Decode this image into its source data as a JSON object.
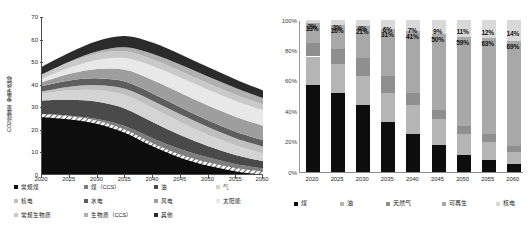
{
  "left_chart": {
    "ylabel": "CO2排放量（发电+终端）",
    "yticks": [
      "70",
      "60",
      "50",
      "40",
      "30",
      "20",
      "10",
      "0"
    ],
    "xticks": [
      "2020",
      "2025",
      "2030",
      "2035",
      "2040",
      "2045",
      "2050",
      "2055",
      "2060"
    ],
    "legend": [
      {
        "label": "常规煤",
        "color": "#0d0d0d"
      },
      {
        "label": "煤（CCS）",
        "color": "#7d7d7d"
      },
      {
        "label": "油",
        "color": "#4a4a4a"
      },
      {
        "label": "气",
        "color": "#d4d4d4"
      },
      {
        "label": "核电",
        "color": "#bfbfbf"
      },
      {
        "label": "水电",
        "color": "#5e5e5e"
      },
      {
        "label": "风电",
        "color": "#9e9e9e"
      },
      {
        "label": "太阳能",
        "color": "#e8e8e8"
      },
      {
        "label": "常规生物质",
        "color": "#c9c9c9"
      },
      {
        "label": "生物质（CCS）",
        "color": "#b0b0b0"
      },
      {
        "label": "其他",
        "color": "#2b2b2b"
      }
    ]
  },
  "right_chart": {
    "yticks": [
      "100%",
      "80%",
      "60%",
      "40%",
      "20%",
      "0%"
    ],
    "xticks": [
      "2020",
      "2025",
      "2030",
      "2035",
      "2040",
      "2045",
      "2050",
      "2055",
      "2060"
    ],
    "legend": [
      {
        "label": "煤",
        "color": "#0d0d0d"
      },
      {
        "label": "油",
        "color": "#b5b5b5"
      },
      {
        "label": "天然气",
        "color": "#8f8f8f"
      },
      {
        "label": "可再生",
        "color": "#a8a8a8"
      },
      {
        "label": "核电",
        "color": "#d9d9d9"
      }
    ],
    "labels_top": [
      "2%",
      "3%",
      "4%",
      "6%",
      "7%",
      "9%",
      "11%",
      "12%",
      "14%"
    ],
    "labels_mid": [
      "13%",
      "16%",
      "21%",
      "31%",
      "41%",
      "50%",
      "59%",
      "63%",
      "69%"
    ]
  },
  "chart_data": [
    {
      "type": "area",
      "title": "",
      "xlabel": "",
      "ylabel": "CO2排放量（发电+终端）",
      "x": [
        2020,
        2025,
        2030,
        2035,
        2040,
        2045,
        2050,
        2055,
        2060
      ],
      "xlim": [
        2020,
        2060
      ],
      "ylim": [
        0,
        70
      ],
      "yticks": [
        0,
        10,
        20,
        30,
        40,
        50,
        60,
        70
      ],
      "grid": false,
      "legend_position": "bottom",
      "stacked": true,
      "series": [
        {
          "name": "常规煤",
          "color": "#0d0d0d",
          "values": [
            27.0,
            26.0,
            24.0,
            20.0,
            14.0,
            9.0,
            5.5,
            3.0,
            1.5
          ]
        },
        {
          "name": "煤（CCS）",
          "color": "#7d7d7d",
          "values": [
            0.0,
            0.3,
            0.8,
            1.6,
            2.2,
            2.4,
            2.2,
            1.8,
            1.4
          ]
        },
        {
          "name": "油",
          "color": "#4a4a4a",
          "values": [
            6.0,
            7.0,
            7.6,
            7.8,
            7.2,
            6.2,
            5.0,
            4.0,
            3.2
          ]
        },
        {
          "name": "气",
          "color": "#d4d4d4",
          "values": [
            3.0,
            4.2,
            5.2,
            6.0,
            6.2,
            5.8,
            5.0,
            4.2,
            3.4
          ]
        },
        {
          "name": "核电",
          "color": "#bfbfbf",
          "values": [
            1.0,
            1.6,
            2.2,
            2.8,
            3.2,
            3.4,
            3.4,
            3.2,
            3.0
          ]
        },
        {
          "name": "水电",
          "color": "#5e5e5e",
          "values": [
            2.4,
            2.8,
            3.0,
            3.2,
            3.2,
            3.1,
            3.0,
            2.9,
            2.8
          ]
        },
        {
          "name": "风电",
          "color": "#9e9e9e",
          "values": [
            1.8,
            3.0,
            4.2,
            5.2,
            6.0,
            6.4,
            6.6,
            6.6,
            6.4
          ]
        },
        {
          "name": "太阳能",
          "color": "#e8e8e8",
          "values": [
            1.4,
            2.6,
            4.0,
            5.2,
            6.2,
            6.8,
            7.0,
            7.0,
            6.8
          ]
        },
        {
          "name": "常规生物质",
          "color": "#c9c9c9",
          "values": [
            2.0,
            2.4,
            2.8,
            3.0,
            3.0,
            2.9,
            2.8,
            2.7,
            2.6
          ]
        },
        {
          "name": "生物质（CCS）",
          "color": "#b0b0b0",
          "values": [
            0.0,
            0.4,
            1.0,
            1.8,
            2.4,
            2.8,
            3.0,
            3.0,
            2.8
          ]
        },
        {
          "name": "其他",
          "color": "#2b2b2b",
          "values": [
            3.4,
            4.0,
            4.6,
            5.0,
            5.0,
            4.6,
            4.2,
            3.8,
            3.4
          ]
        }
      ]
    },
    {
      "type": "bar",
      "title": "",
      "xlabel": "",
      "ylabel": "",
      "categories": [
        "2020",
        "2025",
        "2030",
        "2035",
        "2040",
        "2045",
        "2050",
        "2055",
        "2060"
      ],
      "ylim": [
        0,
        100
      ],
      "yticks": [
        0,
        20,
        40,
        60,
        80,
        100
      ],
      "grid": false,
      "legend_position": "bottom",
      "stacked": true,
      "stacked_percent": true,
      "series": [
        {
          "name": "煤",
          "color": "#0d0d0d",
          "values": [
            57,
            52,
            44,
            33,
            25,
            18,
            11,
            8,
            5
          ]
        },
        {
          "name": "油",
          "color": "#b5b5b5",
          "values": [
            19,
            19,
            19,
            19,
            19,
            17,
            14,
            12,
            8
          ]
        },
        {
          "name": "天然气",
          "color": "#8f8f8f",
          "values": [
            9,
            10,
            12,
            11,
            8,
            6,
            5,
            5,
            4
          ]
        },
        {
          "name": "可再生",
          "color": "#a8a8a8",
          "values": [
            13,
            16,
            21,
            31,
            41,
            50,
            59,
            63,
            69
          ]
        },
        {
          "name": "核电",
          "color": "#d9d9d9",
          "values": [
            2,
            3,
            4,
            6,
            7,
            9,
            11,
            12,
            14
          ]
        }
      ],
      "annotations_renewable": [
        "13%",
        "16%",
        "21%",
        "31%",
        "41%",
        "50%",
        "59%",
        "63%",
        "69%"
      ],
      "annotations_nuclear": [
        "2%",
        "3%",
        "4%",
        "6%",
        "7%",
        "9%",
        "11%",
        "12%",
        "14%"
      ]
    }
  ]
}
